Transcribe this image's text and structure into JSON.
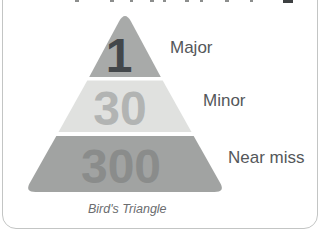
{
  "card": {
    "background": "#ffffff",
    "border_color": "#c3c5c4"
  },
  "diagram": {
    "type": "pyramid",
    "caption": "Bird's Triangle",
    "levels": [
      {
        "value": "1",
        "label": "Major",
        "band_color": "#a8aaa9",
        "value_color": "#43474a"
      },
      {
        "value": "30",
        "label": "Minor",
        "band_color": "#e0e1df",
        "value_color": "#b2b4b3"
      },
      {
        "value": "300",
        "label": "Near miss",
        "band_color": "#a1a3a2",
        "value_color": "#8a8c8b"
      }
    ]
  }
}
